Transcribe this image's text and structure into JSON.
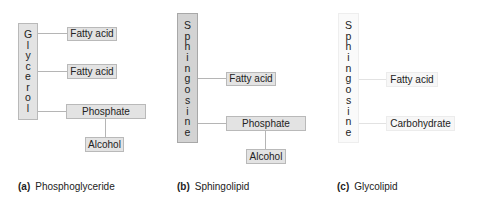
{
  "panels": [
    {
      "id": "a",
      "backbone": "Glycerol",
      "backbone_letters": [
        "G",
        "l",
        "y",
        "c",
        "e",
        "r",
        "o",
        "l"
      ],
      "attachments": [
        "Fatty acid",
        "Fatty acid",
        "Phosphate"
      ],
      "sub_attachment": "Alcohol",
      "caption_letter": "(a)",
      "caption_text": "Phosphoglyceride"
    },
    {
      "id": "b",
      "backbone": "Sphingosine",
      "backbone_letters": [
        "S",
        "p",
        "h",
        "i",
        "n",
        "g",
        "o",
        "s",
        "i",
        "n",
        "e"
      ],
      "attachments": [
        "Fatty acid",
        "Phosphate"
      ],
      "sub_attachment": "Alcohol",
      "caption_letter": "(b)",
      "caption_text": "Sphingolipid"
    },
    {
      "id": "c",
      "backbone": "Sphingosine",
      "backbone_letters": [
        "S",
        "p",
        "h",
        "i",
        "n",
        "g",
        "o",
        "s",
        "i",
        "n",
        "e"
      ],
      "attachments": [
        "Fatty acid",
        "Carbohydrate"
      ],
      "caption_letter": "(c)",
      "caption_text": "Glycolipid"
    }
  ]
}
